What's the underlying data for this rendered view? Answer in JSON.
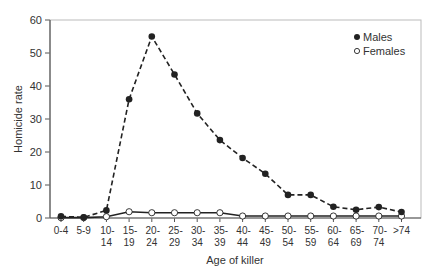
{
  "chart_data": {
    "type": "line",
    "title": "",
    "xlabel": "Age of killer",
    "ylabel": "Homicide rate",
    "ylim": [
      0,
      60
    ],
    "yticks": [
      0,
      10,
      20,
      30,
      40,
      50,
      60
    ],
    "grid": false,
    "legend_position": "top-right",
    "categories": [
      "0-4",
      "5-9",
      "10-14",
      "15-19",
      "20-24",
      "25-29",
      "30-34",
      "35-39",
      "40-44",
      "45-49",
      "50-54",
      "55-59",
      "60-64",
      "65-69",
      "70-74",
      ">74"
    ],
    "category_labels": [
      [
        "0-4",
        ""
      ],
      [
        "5-9",
        ""
      ],
      [
        "10-",
        "14"
      ],
      [
        "15-",
        "19"
      ],
      [
        "20-",
        "24"
      ],
      [
        "25-",
        "29"
      ],
      [
        "30-",
        "34"
      ],
      [
        "35-",
        "39"
      ],
      [
        "40-",
        "44"
      ],
      [
        "45-",
        "49"
      ],
      [
        "50-",
        "54"
      ],
      [
        "55-",
        "59"
      ],
      [
        "60-",
        "64"
      ],
      [
        "65-",
        "69"
      ],
      [
        "70-",
        "74"
      ],
      [
        ">74",
        ""
      ]
    ],
    "series": [
      {
        "name": "Males",
        "marker": "filled-circle",
        "line": "dashed",
        "color": "#222222",
        "values": [
          0.5,
          0.2,
          2.3,
          36,
          55,
          43.5,
          31.7,
          23.6,
          18.2,
          13.4,
          7,
          7,
          3.4,
          2.5,
          3.3,
          1.8
        ]
      },
      {
        "name": "Females",
        "marker": "open-circle",
        "line": "solid",
        "color": "#222222",
        "values": [
          0.1,
          0.1,
          0.4,
          1.9,
          1.6,
          1.6,
          1.6,
          1.6,
          0.6,
          0.6,
          0.6,
          0.6,
          0.6,
          0.6,
          0.6,
          0.6
        ]
      }
    ]
  },
  "legend": {
    "males_label": "Males",
    "females_label": "Females"
  },
  "axes": {
    "xlabel": "Age of killer",
    "ylabel": "Homicide rate"
  }
}
